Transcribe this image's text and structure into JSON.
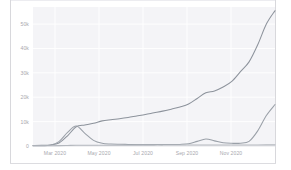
{
  "chart_data": {
    "type": "line",
    "title": "",
    "subtitle": "",
    "xlabel": "",
    "ylabel": "",
    "grid": true,
    "legend": "none",
    "xlim": [
      "2020-01-15",
      "2020-12-15"
    ],
    "ylim": [
      0,
      57000
    ],
    "y_ticks": [
      0,
      10000,
      20000,
      30000,
      40000,
      50000
    ],
    "y_tick_labels": [
      "0",
      "10k",
      "20k",
      "30k",
      "40k",
      "50k"
    ],
    "x_tick_labels": [
      "Mar 2020",
      "May 2020",
      "Jul 2020",
      "Sep 2020",
      "Nov 2020"
    ],
    "x_tick_positions": [
      1.5,
      3.5,
      5.5,
      7.5,
      9.5
    ],
    "x": [
      "2020-01-15",
      "2020-02-01",
      "2020-02-15",
      "2020-02-22",
      "2020-03-01",
      "2020-03-08",
      "2020-03-15",
      "2020-03-22",
      "2020-04-01",
      "2020-04-15",
      "2020-05-01",
      "2020-05-15",
      "2020-06-01",
      "2020-06-15",
      "2020-07-01",
      "2020-07-15",
      "2020-08-01",
      "2020-08-15",
      "2020-08-25",
      "2020-09-01",
      "2020-09-10",
      "2020-09-20",
      "2020-10-01",
      "2020-10-15",
      "2020-11-01",
      "2020-11-15",
      "2020-12-01",
      "2020-12-10",
      "2020-12-15"
    ],
    "series": [
      {
        "name": "series-1",
        "color": "#8d939c",
        "values": [
          200,
          250,
          400,
          1200,
          4200,
          7900,
          8600,
          9300,
          10300,
          10800,
          11200,
          11700,
          12300,
          12900,
          13600,
          14300,
          15100,
          16000,
          17200,
          19500,
          21800,
          22600,
          24200,
          26500,
          30500,
          34500,
          41500,
          50000,
          55500
        ]
      },
      {
        "name": "series-2",
        "color": "#9aa0a8",
        "values": [
          100,
          150,
          350,
          1800,
          5600,
          8200,
          5200,
          2300,
          1100,
          800,
          700,
          650,
          600,
          600,
          600,
          600,
          600,
          650,
          900,
          1900,
          2900,
          2100,
          1300,
          1100,
          1150,
          1900,
          6200,
          12500,
          17000
        ]
      },
      {
        "name": "series-3",
        "color": "#b4b8be",
        "values": [
          80,
          90,
          110,
          150,
          230,
          320,
          330,
          330,
          340,
          340,
          350,
          350,
          360,
          360,
          370,
          370,
          380,
          380,
          390,
          400,
          410,
          410,
          420,
          420,
          430,
          440,
          450,
          460,
          470
        ]
      }
    ]
  },
  "axis": {
    "y_labels": [
      "50k",
      "40k",
      "30k",
      "20k",
      "10k",
      "0"
    ],
    "x_labels": [
      "Mar 2020",
      "May 2020",
      "Jul 2020",
      "Sep 2020",
      "Nov 2020"
    ]
  }
}
